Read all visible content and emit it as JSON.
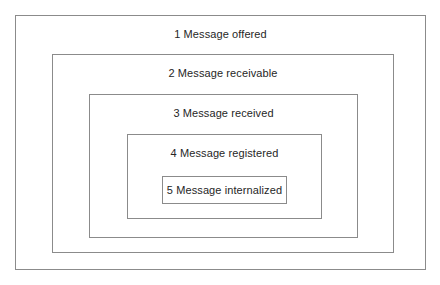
{
  "diagram": {
    "canvas": {
      "width": 440,
      "height": 285
    },
    "style": {
      "background_color": "#ffffff",
      "border_color": "#8b8b8b",
      "text_color": "#262626",
      "border_width_px": 1,
      "font_size_px": 11
    },
    "levels": [
      {
        "number": "1",
        "label": "1 Message offered",
        "name": "message-offered",
        "geometry": {
          "left": 15,
          "top": 15,
          "width": 411,
          "height": 255
        },
        "label_position": "top"
      },
      {
        "number": "2",
        "label": "2 Message receivable",
        "name": "message-receivable",
        "geometry": {
          "left": 51,
          "top": 53,
          "width": 342,
          "height": 199
        },
        "label_position": "top"
      },
      {
        "number": "3",
        "label": "3 Message received",
        "name": "message-received",
        "geometry": {
          "left": 87,
          "top": 92,
          "width": 269,
          "height": 144
        },
        "label_position": "top"
      },
      {
        "number": "4",
        "label": "4 Message registered",
        "name": "message-registered",
        "geometry": {
          "left": 124,
          "top": 131,
          "width": 195,
          "height": 85
        },
        "label_position": "top"
      },
      {
        "number": "5",
        "label": "5 Message internalized",
        "name": "message-internalized",
        "geometry": {
          "left": 158,
          "top": 172,
          "width": 125,
          "height": 28
        },
        "label_position": "center"
      }
    ]
  }
}
